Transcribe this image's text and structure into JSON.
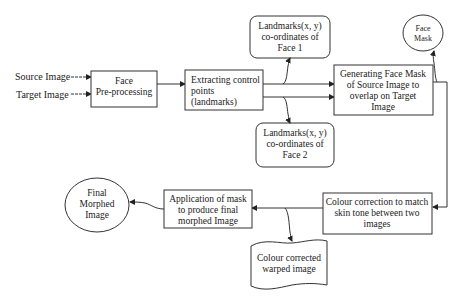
{
  "diagram": {
    "inputs": [
      {
        "id": "source",
        "label": "Source Image"
      },
      {
        "id": "target",
        "label": "Target Image"
      }
    ],
    "nodes": [
      {
        "id": "preprocess",
        "shape": "rectangle",
        "lines": [
          "Face",
          "Pre-processing"
        ]
      },
      {
        "id": "extract",
        "shape": "rectangle",
        "lines": [
          "Extracting control",
          "points",
          "(landmarks)"
        ]
      },
      {
        "id": "landmarks1",
        "shape": "rounded-rectangle",
        "lines": [
          "Landmarks(x, y)",
          "co-ordinates of",
          "Face 1"
        ]
      },
      {
        "id": "landmarks2",
        "shape": "rounded-rectangle",
        "lines": [
          "Landmarks(x, y)",
          "co-ordinates of",
          "Face 2"
        ]
      },
      {
        "id": "facemask_gen",
        "shape": "rectangle",
        "lines": [
          "Generating Face Mask",
          "of Source Image to",
          "overlap on Target",
          "Image"
        ]
      },
      {
        "id": "facemask",
        "shape": "ellipse",
        "lines": [
          "Face",
          "Mask"
        ]
      },
      {
        "id": "colour_correction",
        "shape": "rectangle",
        "lines": [
          "Colour correction to match",
          "skin tone between two",
          "images"
        ]
      },
      {
        "id": "warped",
        "shape": "document",
        "lines": [
          "Colour corrected",
          "warped image"
        ]
      },
      {
        "id": "apply_mask",
        "shape": "rectangle",
        "lines": [
          "Application of mask",
          "to produce final",
          "morphed Image"
        ]
      },
      {
        "id": "final",
        "shape": "ellipse",
        "lines": [
          "Final",
          "Morphed",
          "Image"
        ]
      }
    ],
    "edges": [
      {
        "from": "source",
        "to": "preprocess"
      },
      {
        "from": "target",
        "to": "preprocess"
      },
      {
        "from": "preprocess",
        "to": "extract"
      },
      {
        "from": "extract",
        "to": "landmarks1"
      },
      {
        "from": "extract",
        "to": "landmarks2"
      },
      {
        "from": "extract",
        "to": "facemask_gen"
      },
      {
        "from": "extract",
        "to": "facemask_gen"
      },
      {
        "from": "facemask_gen",
        "to": "facemask"
      },
      {
        "from": "facemask_gen",
        "to": "colour_correction"
      },
      {
        "from": "colour_correction",
        "to": "apply_mask"
      },
      {
        "from": "colour_correction",
        "to": "warped"
      },
      {
        "from": "apply_mask",
        "to": "final"
      }
    ],
    "colors": {
      "stroke": "#333333",
      "text": "#222222",
      "background": "#ffffff"
    }
  }
}
